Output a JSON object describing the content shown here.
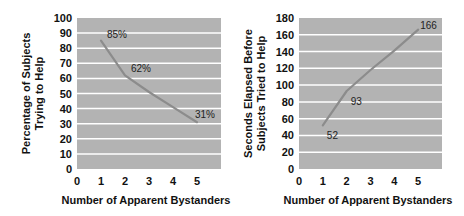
{
  "chart_data": [
    {
      "type": "line",
      "title": "",
      "xlabel": "Number of Apparent Bystanders",
      "ylabel": "Percentage of Subjects Trying to Help",
      "ylabel_lines": [
        "Percentage of Subjects",
        "Trying to Help"
      ],
      "x": [
        1,
        2,
        3,
        4,
        5
      ],
      "series": [
        {
          "name": "Percentage helping",
          "values": [
            85,
            62,
            51,
            41,
            31
          ]
        }
      ],
      "data_labels": [
        {
          "x": 1,
          "y": 85,
          "text": "85%"
        },
        {
          "x": 2,
          "y": 62,
          "text": "62%"
        },
        {
          "x": 5,
          "y": 31,
          "text": "31%"
        }
      ],
      "xticks": [
        "0",
        "1",
        "2",
        "3",
        "4",
        "5"
      ],
      "yticks": [
        "0",
        "10",
        "20",
        "30",
        "40",
        "50",
        "60",
        "70",
        "80",
        "90",
        "100"
      ],
      "xlim": [
        0,
        6
      ],
      "ylim": [
        0,
        100
      ],
      "grid": true,
      "legend": "none",
      "colors": {
        "plot_bg": "#b3b3b3",
        "grid": "#ffffff",
        "line": "#8c8c8c"
      }
    },
    {
      "type": "line",
      "title": "",
      "xlabel": "Number of Apparent Bystanders",
      "ylabel": "Seconds Elapsed Before Subjects Tried to Help",
      "ylabel_lines": [
        "Seconds Elapsed Before",
        "Subjects Tried to Help"
      ],
      "x": [
        1,
        2,
        3,
        4,
        5
      ],
      "series": [
        {
          "name": "Seconds elapsed",
          "values": [
            52,
            93,
            118,
            141,
            166
          ]
        }
      ],
      "data_labels": [
        {
          "x": 1,
          "y": 52,
          "text": "52"
        },
        {
          "x": 2,
          "y": 93,
          "text": "93"
        },
        {
          "x": 5,
          "y": 166,
          "text": "166"
        }
      ],
      "xticks": [
        "0",
        "1",
        "2",
        "3",
        "4",
        "5"
      ],
      "yticks": [
        "0",
        "20",
        "40",
        "60",
        "80",
        "100",
        "120",
        "140",
        "160",
        "180"
      ],
      "xlim": [
        0,
        6
      ],
      "ylim": [
        0,
        180
      ],
      "grid": true,
      "legend": "none",
      "colors": {
        "plot_bg": "#b3b3b3",
        "grid": "#ffffff",
        "line": "#8c8c8c"
      }
    }
  ]
}
